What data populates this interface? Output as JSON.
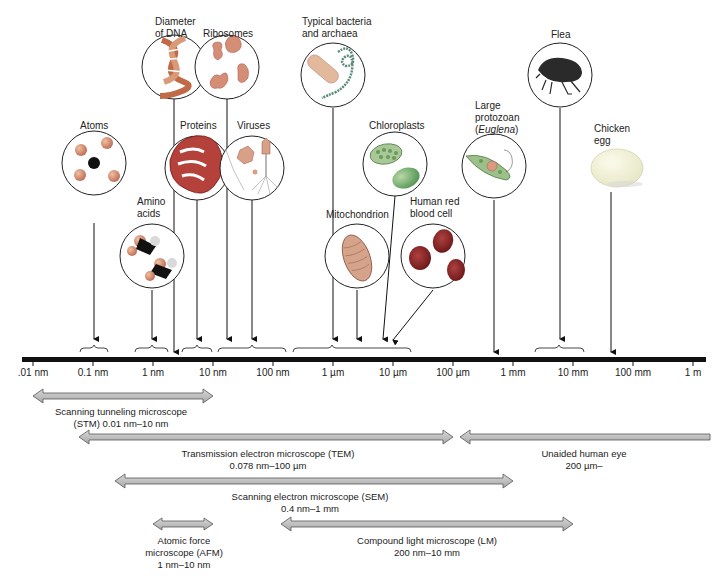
{
  "figure": {
    "scale": {
      "ticks": [
        ".01 nm",
        "0.1 nm",
        "1 nm",
        "10 nm",
        "100 nm",
        "1 µm",
        "10 µm",
        "100 µm",
        "1 mm",
        "10 mm",
        "100 mm",
        "1 m"
      ]
    },
    "objects": [
      {
        "id": "atoms",
        "label": "Atoms"
      },
      {
        "id": "amino-acids",
        "label_line1": "Amino",
        "label_line2": "acids"
      },
      {
        "id": "dna",
        "label_line1": "Diameter",
        "label_line2": "of DNA"
      },
      {
        "id": "ribosomes",
        "label": "Ribosomes"
      },
      {
        "id": "proteins",
        "label": "Proteins"
      },
      {
        "id": "viruses",
        "label": "Viruses"
      },
      {
        "id": "bacteria",
        "label_line1": "Typical bacteria",
        "label_line2": "and archaea"
      },
      {
        "id": "mitochondrion",
        "label": "Mitochondrion"
      },
      {
        "id": "chloroplasts",
        "label": "Chloroplasts"
      },
      {
        "id": "rbc",
        "label_line1": "Human red",
        "label_line2": "blood cell"
      },
      {
        "id": "protozoan",
        "label_line1": "Large",
        "label_line2": "protozoan",
        "label_line3_pre": "(",
        "label_line3_em": "Euglena",
        "label_line3_post": ")"
      },
      {
        "id": "flea",
        "label": "Flea"
      },
      {
        "id": "egg",
        "label_line1": "Chicken",
        "label_line2": "egg"
      }
    ],
    "instruments": [
      {
        "id": "stm",
        "line1": "Scanning tunneling microscope",
        "line2": "(STM) 0.01 nm–10 nm"
      },
      {
        "id": "tem",
        "line1": "Transmission electron microscope (TEM)",
        "line2": "0.078 nm–100 µm"
      },
      {
        "id": "eye",
        "line1": "Unaided human eye",
        "line2": "200 µm–"
      },
      {
        "id": "sem",
        "line1": "Scanning electron microscope (SEM)",
        "line2": "0.4 nm–1 mm"
      },
      {
        "id": "afm",
        "line1": "Atomic force",
        "line2": "microscope (AFM)",
        "line3": "1 nm–10 nm"
      },
      {
        "id": "lm",
        "line1": "Compound light microscope (LM)",
        "line2": "200 nm–10 mm"
      }
    ]
  }
}
